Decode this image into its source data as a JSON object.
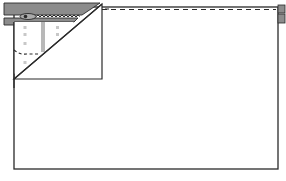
{
  "diagram": {
    "colors": {
      "outline": "#2a2a2a",
      "zipper_tape": "#8c8c8c",
      "fabric": "#ffffff",
      "stitch_dots": "#c8c8c8",
      "stripe": "#b8b8b8"
    },
    "parts": [
      {
        "id": "main-panel",
        "label": "Main fabric panel"
      },
      {
        "id": "zipper-tape-top",
        "label": "Zipper tape (top)"
      },
      {
        "id": "zipper-tape-bottom",
        "label": "Zipper tape (bottom)"
      },
      {
        "id": "zipper-pull",
        "label": "Zipper pull"
      },
      {
        "id": "folded-corner",
        "label": "Folded corner flap"
      },
      {
        "id": "stitch-line",
        "label": "Dashed stitching line"
      }
    ]
  }
}
